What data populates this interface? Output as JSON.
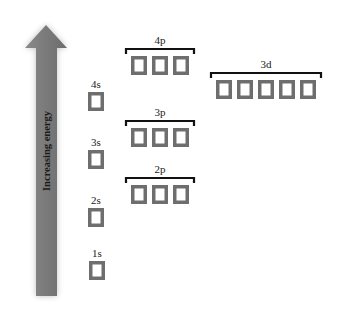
{
  "arrow": {
    "label": "Increasing energy",
    "color": "#7a7a7a",
    "direction": "up"
  },
  "orbitals": [
    {
      "id": "1s",
      "label": "1s",
      "boxes": 1,
      "grouped": false
    },
    {
      "id": "2s",
      "label": "2s",
      "boxes": 1,
      "grouped": false
    },
    {
      "id": "2p",
      "label": "2p",
      "boxes": 3,
      "grouped": true
    },
    {
      "id": "3s",
      "label": "3s",
      "boxes": 1,
      "grouped": false
    },
    {
      "id": "3p",
      "label": "3p",
      "boxes": 3,
      "grouped": true
    },
    {
      "id": "4s",
      "label": "4s",
      "boxes": 1,
      "grouped": false
    },
    {
      "id": "3d",
      "label": "3d",
      "boxes": 5,
      "grouped": true
    },
    {
      "id": "4p",
      "label": "4p",
      "boxes": 3,
      "grouped": true
    }
  ],
  "colors": {
    "box_border": "#6e6e6e",
    "bracket": "#111111",
    "text": "#222222"
  }
}
